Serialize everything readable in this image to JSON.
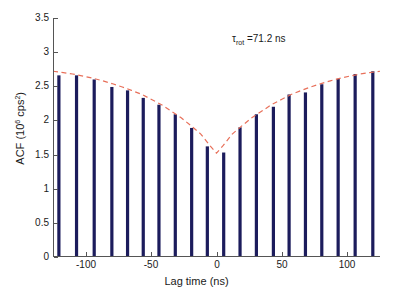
{
  "chart_data": {
    "type": "bar",
    "title": "",
    "subtitle": "",
    "xlabel": "Lag time (ns)",
    "ylabel": "ACF (10^6 cps^2)",
    "ylabel_parts": {
      "prefix": "ACF (10",
      "exp1": "6",
      "mid": " cps",
      "exp2": "2",
      "suffix": ")"
    },
    "xlim": [
      -125,
      125
    ],
    "ylim": [
      0,
      3.5
    ],
    "xticks": [
      -100,
      -50,
      0,
      50,
      100
    ],
    "xticklabels": [
      "-100",
      "-50",
      "0",
      "50",
      "100"
    ],
    "yticks": [
      0,
      0.5,
      1,
      1.5,
      2,
      2.5,
      3,
      3.5
    ],
    "yticklabels": [
      "0",
      "0.5",
      "1",
      "1.5",
      "2",
      "2.5",
      "3",
      "3.5"
    ],
    "grid": false,
    "legend": "none",
    "bar_color": "#1c1c5c",
    "fit_color": "#e8705a",
    "axis_color": "#555555",
    "x": [
      -120.5,
      -107.0,
      -93.5,
      -80.0,
      -68.0,
      -56.0,
      -44.0,
      -31.5,
      -19.0,
      -7.0,
      5.5,
      18.0,
      30.5,
      43.5,
      55.5,
      68.0,
      80.5,
      93.0,
      106.0,
      119.5
    ],
    "values": [
      2.66,
      2.66,
      2.6,
      2.49,
      2.44,
      2.33,
      2.23,
      2.09,
      1.89,
      1.62,
      1.53,
      1.9,
      2.09,
      2.2,
      2.38,
      2.41,
      2.53,
      2.61,
      2.68,
      2.72
    ],
    "series": [
      {
        "name": "ACF data",
        "type": "bar",
        "values": [
          2.66,
          2.66,
          2.6,
          2.49,
          2.44,
          2.33,
          2.23,
          2.09,
          1.89,
          1.62,
          1.53,
          1.9,
          2.09,
          2.2,
          2.38,
          2.41,
          2.53,
          2.61,
          2.68,
          2.72
        ]
      },
      {
        "name": "Exponential fit",
        "type": "line",
        "style": "dashed",
        "x": [
          -125,
          -117,
          -110,
          -102,
          -95,
          -87,
          -80,
          -72,
          -65,
          -57,
          -50,
          -42,
          -35,
          -27,
          -20,
          -12,
          -5,
          0,
          5,
          12,
          20,
          27,
          35,
          42,
          50,
          57,
          65,
          72,
          80,
          87,
          95,
          102,
          110,
          117,
          125
        ],
        "values": [
          2.72,
          2.7,
          2.68,
          2.65,
          2.62,
          2.58,
          2.54,
          2.49,
          2.44,
          2.38,
          2.31,
          2.23,
          2.14,
          2.04,
          1.93,
          1.8,
          1.63,
          1.52,
          1.63,
          1.8,
          1.93,
          2.04,
          2.14,
          2.23,
          2.31,
          2.38,
          2.44,
          2.49,
          2.54,
          2.58,
          2.62,
          2.65,
          2.68,
          2.7,
          2.72
        ]
      }
    ],
    "annotations": [
      {
        "name": "tau-rot",
        "text": "τrot =71.2 ns",
        "symbol": "τ",
        "subscript": "rot",
        "equals": " =71.2 ns",
        "value": 71.2,
        "unit": "ns",
        "x": 60,
        "y": 3.1
      }
    ]
  }
}
